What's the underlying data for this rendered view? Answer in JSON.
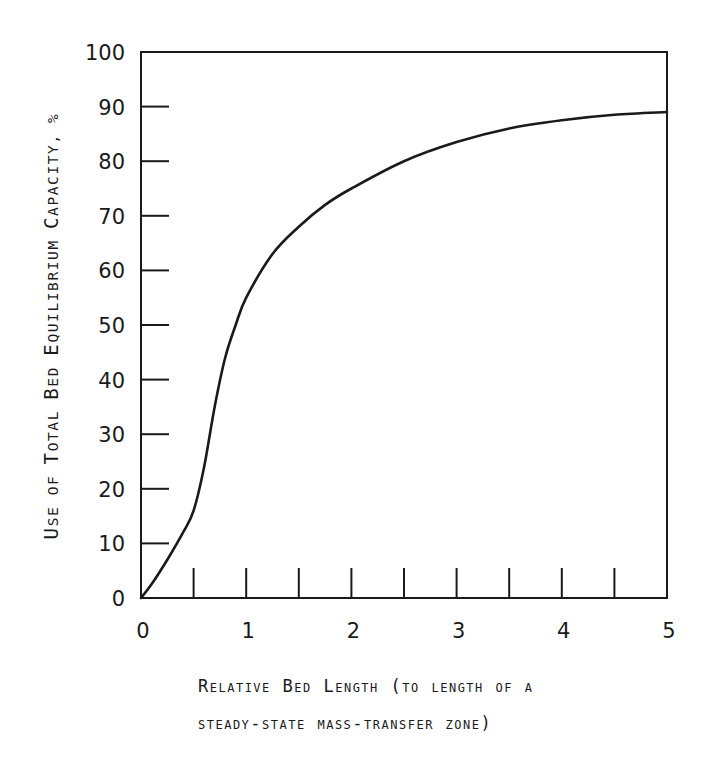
{
  "chart_data": {
    "type": "line",
    "title": "",
    "xlabel": "Relative Bed Length (to length of a steady-state mass-transfer zone)",
    "ylabel": "Use of Total Bed Equilibrium Capacity, %",
    "xlim": [
      0,
      5
    ],
    "ylim": [
      0,
      100
    ],
    "grid": false,
    "legend": null,
    "x_ticks": [
      "0",
      "1",
      "2",
      "3",
      "4",
      "5"
    ],
    "x_minor_ticks": [
      0.5,
      1,
      1.5,
      2,
      2.5,
      3,
      3.5,
      4,
      4.5
    ],
    "y_ticks": [
      "0",
      "10",
      "20",
      "30",
      "40",
      "50",
      "60",
      "70",
      "80",
      "90",
      "100"
    ],
    "series": [
      {
        "name": "Capacity utilization",
        "x": [
          0,
          0.1,
          0.25,
          0.4,
          0.5,
          0.6,
          0.7,
          0.8,
          0.9,
          1.0,
          1.25,
          1.5,
          1.75,
          2.0,
          2.5,
          3.0,
          3.5,
          4.0,
          4.5,
          5.0
        ],
        "values": [
          0,
          2.5,
          7,
          12,
          16,
          24,
          35,
          44,
          50,
          55,
          63,
          68,
          72,
          75,
          80,
          83.5,
          86,
          87.5,
          88.5,
          89
        ]
      }
    ]
  },
  "labels": {
    "ylabel_parts": [
      "U",
      "SE OF ",
      "T",
      "OTAL ",
      "B",
      "ED ",
      "E",
      "QUILIBRIUM ",
      "C",
      "APACITY, %"
    ],
    "xlabel_line1": "Relative Bed Length (to length of a",
    "xlabel_line2": "steady-state mass-transfer zone)"
  }
}
